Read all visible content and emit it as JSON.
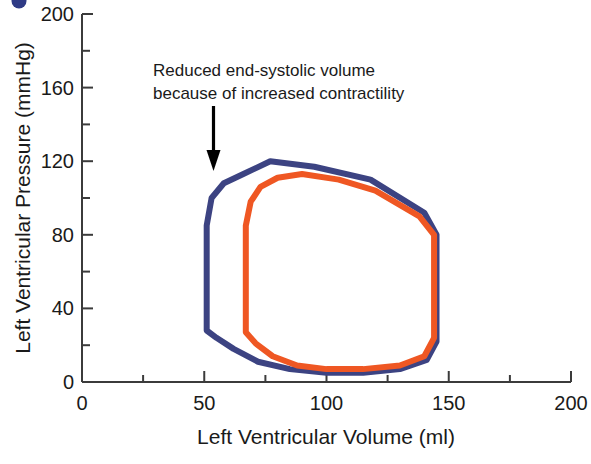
{
  "figure": {
    "corner_marker": "partial-dark-blue-circle",
    "background_color": "#ffffff"
  },
  "chart_data": {
    "type": "line",
    "title": "",
    "xlabel": "Left Ventricular Volume (ml)",
    "ylabel": "Left Ventricular Pressure (mmHg)",
    "xlim": [
      0,
      200
    ],
    "ylim": [
      0,
      200
    ],
    "xticks": [
      0,
      50,
      100,
      150,
      200
    ],
    "xticklabels": [
      "0",
      "50",
      "100",
      "150",
      "200"
    ],
    "yticks": [
      0,
      40,
      80,
      120,
      160,
      200
    ],
    "yticklabels": [
      "0",
      "40",
      "80",
      "120",
      "160",
      "200"
    ],
    "x_minor_tick_interval": 25,
    "y_minor_tick_interval": 20,
    "grid": false,
    "legend": "none",
    "series": [
      {
        "name": "Increased contractility loop",
        "color": "#3c4382",
        "closed": true,
        "points": [
          [
            51,
            28
          ],
          [
            51,
            55
          ],
          [
            51,
            85
          ],
          [
            53,
            100
          ],
          [
            58,
            108
          ],
          [
            66,
            113
          ],
          [
            77,
            120
          ],
          [
            95,
            117
          ],
          [
            118,
            110
          ],
          [
            140,
            92
          ],
          [
            145,
            80
          ],
          [
            145,
            45
          ],
          [
            145,
            22
          ],
          [
            141,
            12
          ],
          [
            130,
            7
          ],
          [
            115,
            5
          ],
          [
            100,
            5
          ],
          [
            85,
            7
          ],
          [
            72,
            11
          ],
          [
            62,
            18
          ],
          [
            55,
            24
          ],
          [
            51,
            28
          ]
        ]
      },
      {
        "name": "Baseline loop",
        "color": "#ef5723",
        "closed": true,
        "points": [
          [
            67,
            27
          ],
          [
            67,
            55
          ],
          [
            67,
            85
          ],
          [
            69,
            98
          ],
          [
            73,
            106
          ],
          [
            80,
            111
          ],
          [
            90,
            113
          ],
          [
            105,
            110
          ],
          [
            120,
            104
          ],
          [
            138,
            90
          ],
          [
            144,
            80
          ],
          [
            144,
            45
          ],
          [
            144,
            24
          ],
          [
            140,
            14
          ],
          [
            130,
            9
          ],
          [
            115,
            7
          ],
          [
            100,
            7
          ],
          [
            88,
            9
          ],
          [
            78,
            14
          ],
          [
            71,
            21
          ],
          [
            67,
            27
          ]
        ]
      }
    ],
    "annotations": [
      {
        "name": "reduced-esv-note",
        "text_line_1": "Reduced end-systolic volume",
        "text_line_2": "because of increased contractility",
        "arrow": {
          "from": [
            54,
            154
          ],
          "to": [
            54,
            120
          ],
          "direction": "down"
        }
      }
    ]
  }
}
